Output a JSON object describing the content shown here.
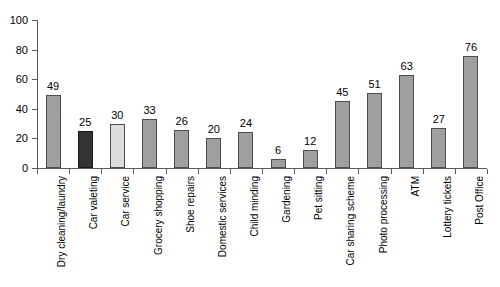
{
  "chart_data": {
    "type": "bar",
    "title": "",
    "subtitle": "",
    "xlabel": "",
    "ylabel": "",
    "ylim": [
      0,
      100
    ],
    "yticks": [
      0,
      20,
      40,
      60,
      80,
      100
    ],
    "grid": false,
    "legend": "none",
    "label_rotation": -90,
    "categories": [
      "Dry cleaning/laundry",
      "Car valeting",
      "Car service",
      "Grocery shopping",
      "Shoe repairs",
      "Domestic services",
      "Child minding",
      "Gardening",
      "Pet sitting",
      "Car sharing scheme",
      "Photo processing",
      "ATM",
      "Lottery tickets",
      "Post Office"
    ],
    "values": [
      49,
      25,
      30,
      33,
      26,
      20,
      24,
      6,
      12,
      45,
      51,
      63,
      27,
      76
    ],
    "bar_styles": [
      "mid",
      "dark",
      "light",
      "mid",
      "mid",
      "mid",
      "mid",
      "mid",
      "mid",
      "mid",
      "mid",
      "mid",
      "mid",
      "mid"
    ],
    "data_labels": [
      "49",
      "25",
      "30",
      "33",
      "26",
      "20",
      "24",
      "6",
      "12",
      "45",
      "51",
      "63",
      "27",
      "76"
    ],
    "colors": {
      "mid": "#a0a0a0",
      "dark": "#333333",
      "light": "#dcdcdc",
      "bar_border": "#4d4d4d",
      "axis": "#5a5a5a",
      "text": "#000000",
      "background": "#ffffff"
    }
  }
}
